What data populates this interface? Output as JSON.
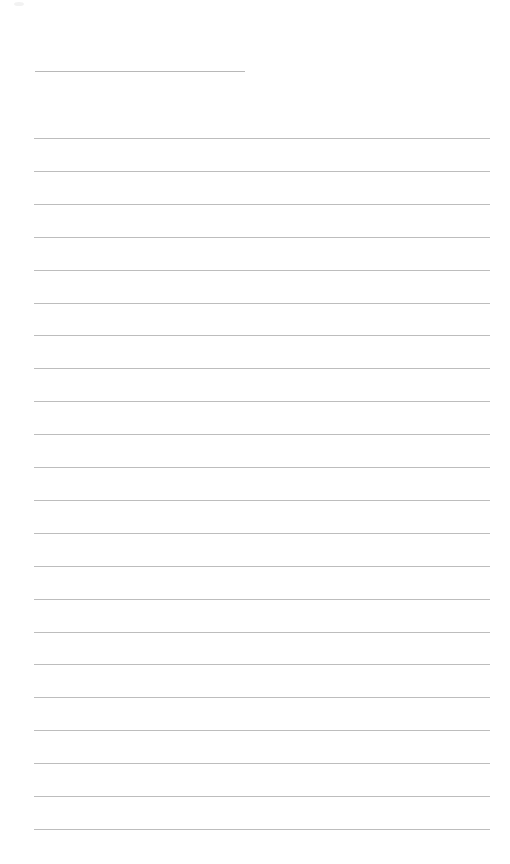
{
  "page": {
    "type": "lined-paper",
    "background": "#ffffff",
    "line_color": "#bdbdbd",
    "header_line": {
      "x": 35,
      "y": 71,
      "width": 210
    },
    "ruled_lines": {
      "count": 22,
      "x": 34,
      "width": 456,
      "first_y": 138,
      "spacing": 32.9
    }
  }
}
